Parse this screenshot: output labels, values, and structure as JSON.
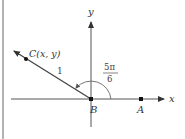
{
  "diagram": {
    "axes": {
      "x_label": "x",
      "y_label": "y"
    },
    "points": {
      "origin_label": "B",
      "a_label": "A",
      "c_label": "C(x, y)"
    },
    "segment_length_label": "1",
    "angle": {
      "numerator": "5π",
      "denominator": "6"
    },
    "colors": {
      "line": "#444444",
      "text": "#333333",
      "border": "#888888"
    }
  }
}
